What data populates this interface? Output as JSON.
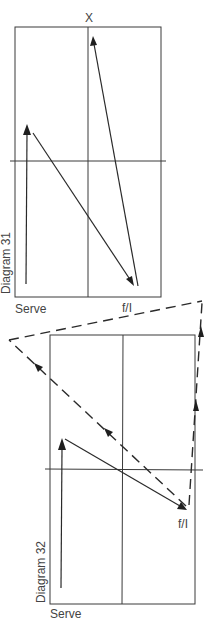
{
  "diagrams": [
    {
      "title": "Diagram 31",
      "axis_top_label": "X",
      "bottom_left_label": "Serve",
      "bottom_right_label": "f/I",
      "path": [
        "Serve (bottom-left)",
        "up to left-mid",
        "diagonal to f/I (bottom-right)",
        "up to X (top-center)"
      ]
    },
    {
      "title": "Diagram 32",
      "bottom_left_label": "Serve",
      "turn_label": "f/I",
      "path": [
        "Serve (bottom-left)",
        "up to left-mid",
        "diagonal to f/I (right, below center line)"
      ],
      "dashed_paths": [
        "f/I back diagonally up-left beyond court",
        "f/I straight up the right sideline to beyond court, then across to top-left"
      ]
    }
  ],
  "colors": {
    "line": "#3a3a3a",
    "background": "#ffffff"
  }
}
